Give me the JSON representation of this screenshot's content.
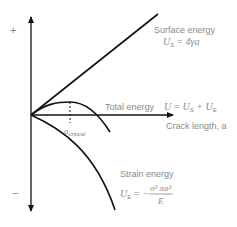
{
  "diagram": {
    "axis": {
      "y_plus": "+",
      "y_minus": "−",
      "x_label": "Crack length, a"
    },
    "curves": {
      "surface": {
        "label": "Surface energy",
        "eq_lhs": "U",
        "eq_lhs_sub": "S",
        "eq_rhs": "= 4γa"
      },
      "total": {
        "label": "Total energy",
        "eq_U": "U",
        "eq_mid": "= U",
        "eq_sub1": "S",
        "eq_plus": " + U",
        "eq_sub2": "E"
      },
      "strain": {
        "label": "Strain energy",
        "eq_lhs": "U",
        "eq_lhs_sub": "E",
        "eq_eq": "= −",
        "numerator": "σ² πa²",
        "denominator": "E"
      }
    },
    "critical": {
      "label": "a",
      "sub": "critical"
    },
    "colors": {
      "line": "#111111",
      "text": "#8a8a8a"
    }
  }
}
